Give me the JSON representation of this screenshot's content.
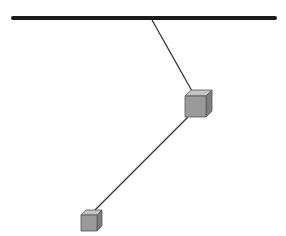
{
  "diagram": {
    "type": "physics-pendulum",
    "colors": {
      "background": "#ffffff",
      "ceiling": "#1a1a1a",
      "string": "#333333",
      "cube_front": "#9a9a9a",
      "cube_top": "#c4c4c4",
      "cube_side": "#7d7d7d",
      "cube_edge": "#555555"
    },
    "ceiling": {
      "x1": 13,
      "y1": 18,
      "x2": 275,
      "y2": 18,
      "thickness": 4
    },
    "strings": [
      {
        "x1": 152,
        "y1": 20,
        "x2": 192,
        "y2": 91
      },
      {
        "x1": 188,
        "y1": 117,
        "x2": 92,
        "y2": 213
      }
    ],
    "masses": [
      {
        "name": "large-cube",
        "x": 185,
        "y": 96,
        "size": 21,
        "depth": 6
      },
      {
        "name": "small-cube",
        "x": 81,
        "y": 215,
        "size": 16,
        "depth": 5
      }
    ]
  }
}
